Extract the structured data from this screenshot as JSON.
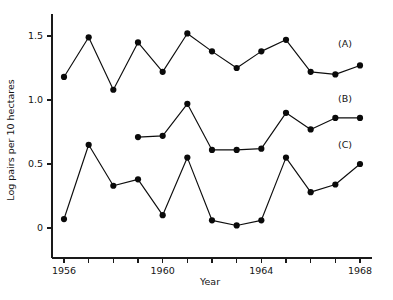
{
  "chart_data": {
    "type": "line",
    "title": "",
    "xlabel": "Year",
    "ylabel": "Log pairs per 10 hectares",
    "xlim": [
      1956,
      1968
    ],
    "ylim": [
      -0.12,
      1.62
    ],
    "grid": false,
    "legend_position": "right-inline",
    "x_ticks": [
      1956,
      1957,
      1958,
      1959,
      1960,
      1961,
      1962,
      1963,
      1964,
      1965,
      1966,
      1967,
      1968
    ],
    "x_tick_labels": [
      "1956",
      "",
      "",
      "",
      "1960",
      "",
      "",
      "",
      "1964",
      "",
      "",
      "",
      "1968"
    ],
    "y_ticks": [
      0,
      0.5,
      1.0,
      1.5
    ],
    "y_tick_labels": [
      "0",
      "0.5",
      "1.0",
      "1.5"
    ],
    "marker": "filled-circle",
    "series": [
      {
        "name": "(A)",
        "label": "(A)",
        "x": [
          1956,
          1957,
          1958,
          1959,
          1960,
          1961,
          1962,
          1963,
          1964,
          1965,
          1966,
          1967,
          1968
        ],
        "values": [
          1.18,
          1.49,
          1.08,
          1.45,
          1.22,
          1.52,
          1.38,
          1.25,
          1.38,
          1.47,
          1.22,
          1.2,
          1.27
        ]
      },
      {
        "name": "(B)",
        "label": "(B)",
        "x": [
          1959,
          1960,
          1961,
          1962,
          1963,
          1964,
          1965,
          1966,
          1967,
          1968
        ],
        "values": [
          0.71,
          0.72,
          0.97,
          0.61,
          0.61,
          0.62,
          0.9,
          0.77,
          0.86,
          0.86
        ]
      },
      {
        "name": "(C)",
        "label": "(C)",
        "x": [
          1956,
          1957,
          1958,
          1959,
          1960,
          1961,
          1962,
          1963,
          1964,
          1965,
          1966,
          1967,
          1968
        ],
        "values": [
          0.07,
          0.65,
          0.33,
          0.38,
          0.1,
          0.55,
          0.06,
          0.02,
          0.06,
          0.55,
          0.28,
          0.34,
          0.5
        ]
      }
    ]
  },
  "axes": {
    "y_title": "Log pairs per 10 hectares",
    "x_title": "Year"
  },
  "labels": {
    "series_a": "(A)",
    "series_b": "(B)",
    "series_c": "(C)"
  },
  "colors": {
    "axis": "#1a1a1a",
    "line": "#0d0d0d",
    "marker": "#0a0a0a",
    "background": "#ffffff",
    "text": "#141414"
  }
}
